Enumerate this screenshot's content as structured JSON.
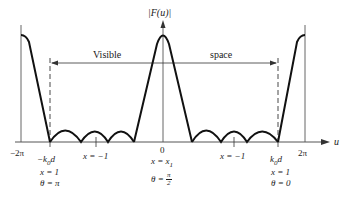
{
  "figure": {
    "y_axis_label": "|F(u)|",
    "x_axis_label": "u",
    "visible_space_label_left": "Visible",
    "visible_space_label_right": "space",
    "ticks": {
      "neg_two_pi": "−2π",
      "two_pi": "2π",
      "zero": "0",
      "neg_k0d": "−k",
      "neg_k0d_sub": "0",
      "neg_k0d_tail": "d",
      "k0d": "k",
      "k0d_sub": "0",
      "k0d_tail": "d",
      "x_neg1_left": "x = −1",
      "x_neg1_right": "x = −1"
    },
    "annotations": {
      "left": {
        "x": "x = 1",
        "theta": "θ = π"
      },
      "center": {
        "x": "x = x",
        "x_sub": "1",
        "theta_prefix": "θ = ",
        "theta_num": "π",
        "theta_den": "2"
      },
      "right": {
        "x": "x = 1",
        "theta": "θ = 0"
      }
    },
    "colors": {
      "stroke": "#1a1a1a",
      "axis": "#555555",
      "background": "#ffffff"
    }
  }
}
